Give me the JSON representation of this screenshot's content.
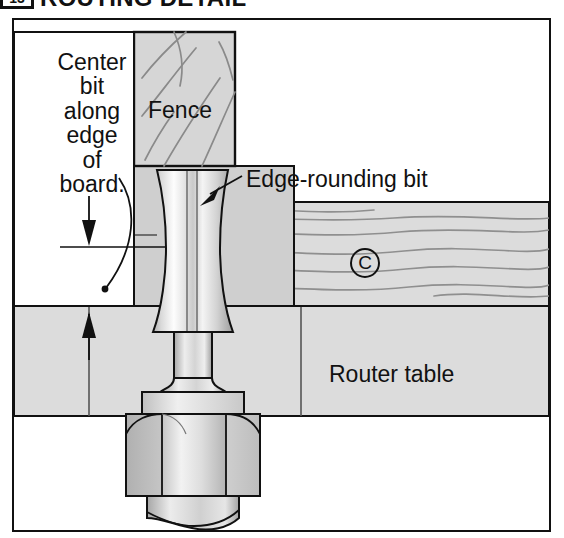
{
  "title": {
    "badge": "13",
    "text": "ROUTING DETAIL"
  },
  "figure": {
    "labels": {
      "center_bit": "Center\nbit\nalong\nedge\nof\nboard.",
      "fence": "Fence",
      "edge_rounding_bit": "Edge-rounding bit",
      "router_table": "Router table",
      "board_callout": "C"
    },
    "colors": {
      "outline": "#111111",
      "wood_fill": "#d8d8d8",
      "wood_grain": "#8a8a8a",
      "table_fill": "#dcdcdc",
      "fence_base_fill": "#cfcfcf",
      "metal_light": "#fbfbfb",
      "metal_mid": "#d2d2d2",
      "metal_dark": "#9a9a9a",
      "background": "#ffffff"
    },
    "parts": [
      {
        "name": "fence",
        "label": "Fence",
        "kind": "wood-block"
      },
      {
        "name": "fence-base",
        "label": "",
        "kind": "gray-block"
      },
      {
        "name": "board",
        "label": "C",
        "kind": "wood-board"
      },
      {
        "name": "router-table",
        "label": "Router table",
        "kind": "gray-block"
      },
      {
        "name": "edge-rounding-bit",
        "label": "Edge-rounding bit",
        "kind": "metal-cutter"
      },
      {
        "name": "collet-nut",
        "label": "",
        "kind": "metal-hex-nut"
      },
      {
        "name": "router-shaft",
        "label": "",
        "kind": "metal-cylinder"
      }
    ],
    "annotations": [
      {
        "name": "rotation-arc-arrow",
        "kind": "curved-arrow"
      },
      {
        "name": "centerline",
        "kind": "horizontal-line"
      },
      {
        "name": "down-arrow",
        "kind": "arrow-down"
      },
      {
        "name": "up-arrow",
        "kind": "arrow-up"
      },
      {
        "name": "leader-line-edge-bit",
        "kind": "leader-with-arrowhead"
      }
    ]
  }
}
